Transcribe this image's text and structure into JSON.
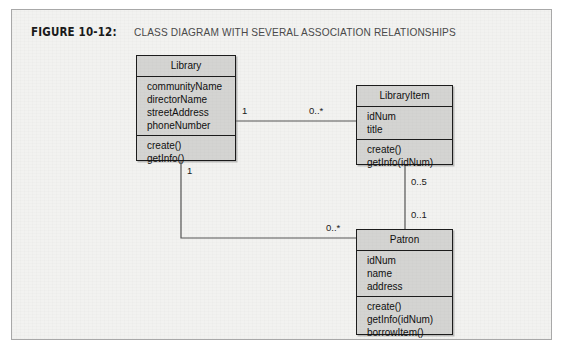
{
  "figure": {
    "label": "FIGURE 10-12:",
    "caption": "CLASS DIAGRAM WITH SEVERAL ASSOCIATION RELATIONSHIPS"
  },
  "colors": {
    "panel_background": "#f2f2f0",
    "panel_border": "#a8a8a8",
    "class_fill": "#d4d4d2",
    "class_border": "#1c1c1c",
    "connector": "#555555",
    "page_background": "#ffffff"
  },
  "diagram": {
    "type": "uml-class-diagram",
    "classes": [
      {
        "id": "library",
        "name": "Library",
        "attributes": [
          "communityName",
          "directorName",
          "streetAddress",
          "phoneNumber"
        ],
        "operations": [
          "create()",
          "getInfo()"
        ]
      },
      {
        "id": "libraryitem",
        "name": "LibraryItem",
        "attributes": [
          "idNum",
          "title"
        ],
        "operations": [
          "create()",
          "getInfo(idNum)"
        ]
      },
      {
        "id": "patron",
        "name": "Patron",
        "attributes": [
          "idNum",
          "name",
          "address"
        ],
        "operations": [
          "create()",
          "getInfo(idNum)",
          "borrowItem()"
        ]
      }
    ],
    "associations": [
      {
        "id": "library-libraryitem",
        "from": "library",
        "to": "libraryitem",
        "from_multiplicity": "1",
        "to_multiplicity": "0..*"
      },
      {
        "id": "library-patron",
        "from": "library",
        "to": "patron",
        "from_multiplicity": "1",
        "to_multiplicity": "0..*"
      },
      {
        "id": "libraryitem-patron",
        "from": "libraryitem",
        "to": "patron",
        "from_multiplicity": "0..5",
        "to_multiplicity": "0..1"
      }
    ]
  }
}
